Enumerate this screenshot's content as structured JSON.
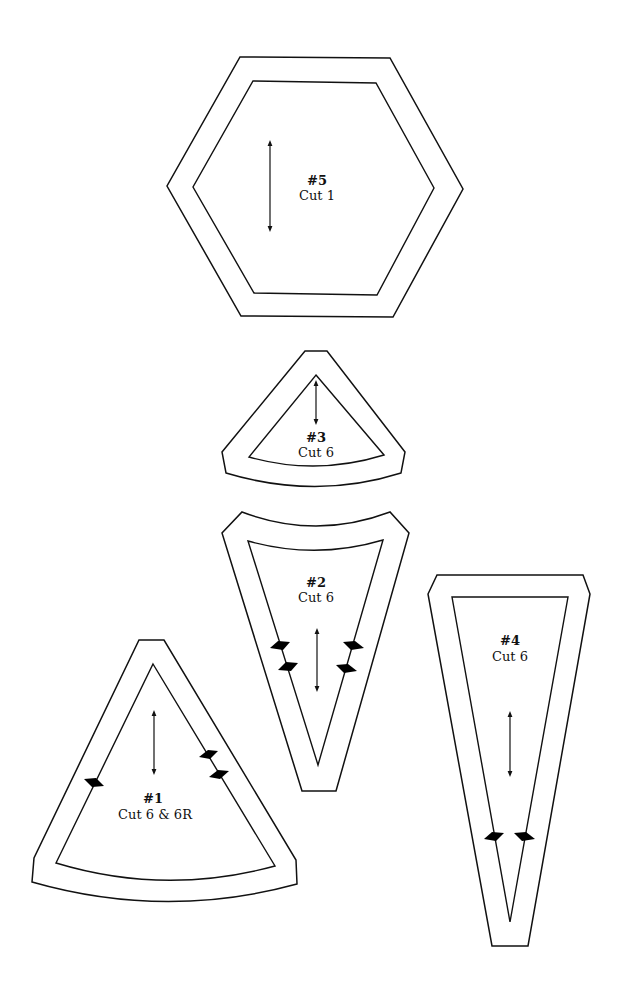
{
  "diagram": {
    "type": "quilt-pattern-templates",
    "stroke_color": "#111111",
    "background": "#ffffff",
    "pieces": [
      {
        "id": "5",
        "number_label": "#5",
        "cut_label": "Cut 1",
        "shape": "hexagon",
        "has_grainline_arrow": true,
        "notches": 0
      },
      {
        "id": "3",
        "number_label": "#3",
        "cut_label": "Cut 6",
        "shape": "curved-base triangle",
        "has_grainline_arrow": true,
        "notches": 0
      },
      {
        "id": "2",
        "number_label": "#2",
        "cut_label": "Cut 6",
        "shape": "curved-top elongated triangle",
        "has_grainline_arrow": true,
        "notches": 4
      },
      {
        "id": "4",
        "number_label": "#4",
        "cut_label": "Cut 6",
        "shape": "long narrow triangle",
        "has_grainline_arrow": true,
        "notches": 2
      },
      {
        "id": "1",
        "number_label": "#1",
        "cut_label": "Cut 6 & 6R",
        "shape": "curved-base wide triangle",
        "has_grainline_arrow": true,
        "notches": 3
      }
    ]
  }
}
